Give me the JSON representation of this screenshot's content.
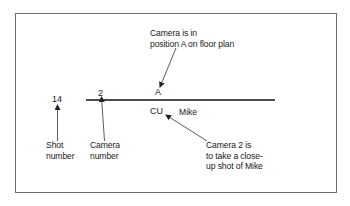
{
  "diagram": {
    "shot_number": "14",
    "camera_number": "2",
    "camera_position": "A",
    "shot_type": "CU",
    "subject": "Mike",
    "annotations": {
      "position": [
        "Camera is in",
        "position A on floor plan"
      ],
      "shot_label": [
        "Shot",
        "number"
      ],
      "camera_label": [
        "Camera",
        "number"
      ],
      "shot_description": [
        "Camera 2 is",
        "to take a close-",
        "up shot of Mike"
      ]
    }
  }
}
